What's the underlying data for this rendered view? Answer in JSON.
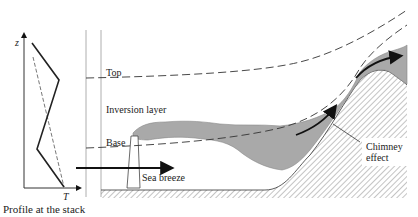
{
  "profile": {
    "caption": "Profile at the stack",
    "y_axis_label": "z",
    "x_axis_label": "T"
  },
  "labels": {
    "top": "Top",
    "inversion_layer": "Inversion layer",
    "base": "Base",
    "sea_breeze": "Sea breeze",
    "chimney_effect_line1": "Chimney",
    "chimney_effect_line2": "effect"
  },
  "colors": {
    "plume": "#a9a9a9",
    "ink": "#222222",
    "hatch": "#888888",
    "background": "#ffffff"
  }
}
